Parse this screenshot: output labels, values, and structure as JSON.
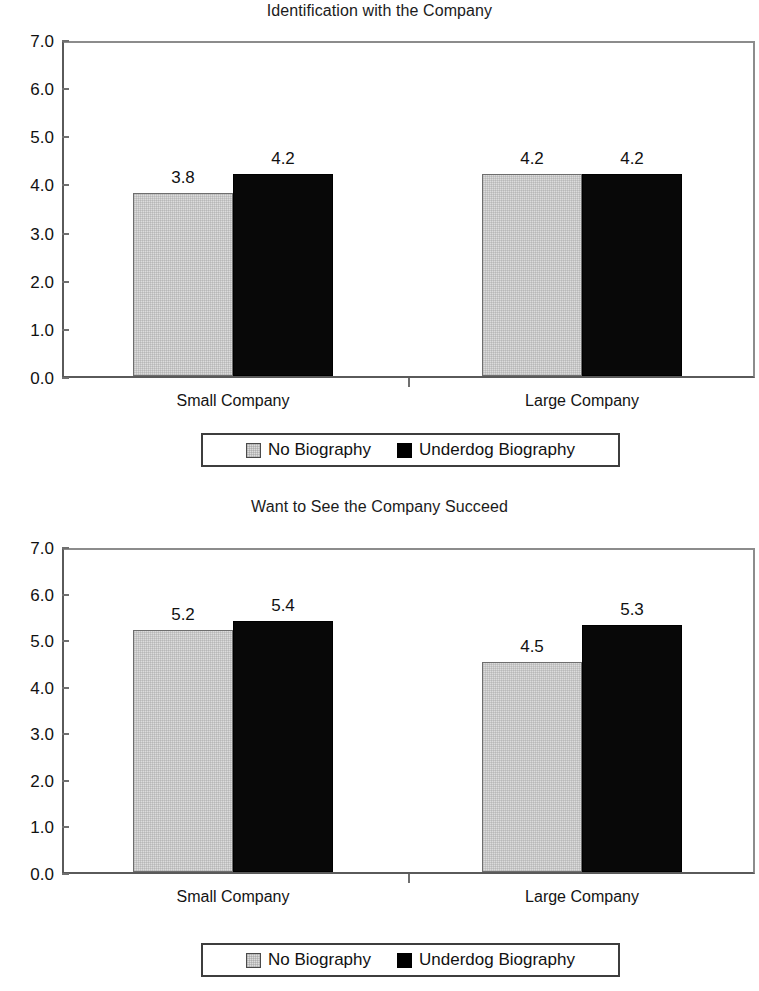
{
  "chart_data": [
    {
      "type": "bar",
      "title": "Identification with the Company",
      "xlabel": "",
      "ylabel": "",
      "ylim": [
        0.0,
        7.0
      ],
      "ytick_step": 1.0,
      "ytick_labels": [
        "0.0",
        "1.0",
        "2.0",
        "3.0",
        "4.0",
        "5.0",
        "6.0",
        "7.0"
      ],
      "grid": false,
      "legend_position": "bottom",
      "categories": [
        "Small Company",
        "Large Company"
      ],
      "series": [
        {
          "name": "No Biography",
          "values": [
            3.8,
            4.2
          ],
          "labels": [
            "3.8",
            "4.2"
          ],
          "color": "#dcdcdc"
        },
        {
          "name": "Underdog Biography",
          "values": [
            4.2,
            4.2
          ],
          "labels": [
            "4.2",
            "4.2"
          ],
          "color": "#000000"
        }
      ]
    },
    {
      "type": "bar",
      "title": "Want to See the Company Succeed",
      "xlabel": "",
      "ylabel": "",
      "ylim": [
        0.0,
        7.0
      ],
      "ytick_step": 1.0,
      "ytick_labels": [
        "0.0",
        "1.0",
        "2.0",
        "3.0",
        "4.0",
        "5.0",
        "6.0",
        "7.0"
      ],
      "grid": false,
      "legend_position": "bottom",
      "categories": [
        "Small Company",
        "Large Company"
      ],
      "series": [
        {
          "name": "No Biography",
          "values": [
            5.2,
            4.5
          ],
          "labels": [
            "5.2",
            "4.5"
          ],
          "color": "#dcdcdc"
        },
        {
          "name": "Underdog Biography",
          "values": [
            5.4,
            5.3
          ],
          "labels": [
            "5.4",
            "5.3"
          ],
          "color": "#000000"
        }
      ]
    }
  ],
  "charts": [
    {
      "title": "Identification with the Company",
      "legend": [
        {
          "label": "No Biography",
          "swatch": "light"
        },
        {
          "label": "Underdog Biography",
          "swatch": "dark"
        }
      ]
    },
    {
      "title": "Want to See the Company Succeed",
      "legend": [
        {
          "label": "No Biography",
          "swatch": "light"
        },
        {
          "label": "Underdog Biography",
          "swatch": "dark"
        }
      ]
    }
  ]
}
